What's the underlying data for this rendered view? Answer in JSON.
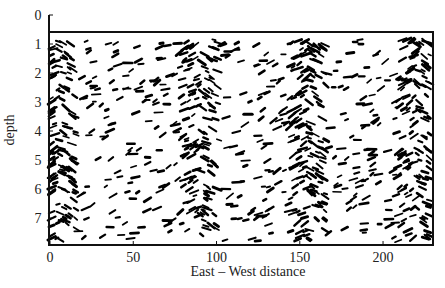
{
  "chart_data": {
    "type": "scatter",
    "title": "",
    "xlabel": "East – West distance",
    "ylabel": "depth",
    "xlim": [
      0,
      230
    ],
    "ylim": [
      0,
      7.8
    ],
    "y_inverted": true,
    "x_ticks": [
      0,
      50,
      100,
      150,
      200
    ],
    "y_ticks": [
      0,
      1,
      2,
      3,
      4,
      5,
      6,
      7
    ],
    "grid": false,
    "legend": null,
    "marker": "short oriented dashes (vector field / streak pattern)",
    "marker_color": "#000000",
    "data_region": {
      "x": [
        0,
        230
      ],
      "y": [
        0.85,
        7.8
      ]
    },
    "dense_columns_x": [
      5,
      90,
      155,
      220
    ]
  },
  "plot": {
    "frame": {
      "left": 49,
      "top": 32,
      "right": 433,
      "bottom": 245
    },
    "y_axis_top": 15,
    "seed": 7,
    "n_dashes": 900
  }
}
